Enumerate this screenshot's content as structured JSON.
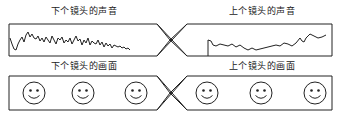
{
  "diagram": {
    "top_row": {
      "left_label": "下个镜头的声音",
      "right_label": "上个镜头的声音",
      "left_content": "audio-waveform",
      "right_content": "audio-waveform"
    },
    "bottom_row": {
      "left_label": "下个镜头的画面",
      "right_label": "上个镜头的画面",
      "left_content": "smiley-faces",
      "right_content": "smiley-faces",
      "faces_per_box": 3
    },
    "colors": {
      "stroke": "#222222",
      "background": "#ffffff"
    }
  }
}
